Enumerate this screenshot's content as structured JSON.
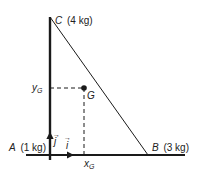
{
  "diagram": {
    "colors": {
      "line": "#1a1a1a",
      "text": "#222222",
      "background": "#ffffff"
    },
    "points": {
      "A": {
        "letter": "A",
        "mass": "(1 kg)"
      },
      "B": {
        "letter": "B",
        "mass": "(3 kg)"
      },
      "C": {
        "letter": "C",
        "mass": "(4 kg)"
      },
      "G": {
        "letter": "G"
      }
    },
    "axes": {
      "x_label": "x",
      "x_sub": "G",
      "y_label": "y",
      "y_sub": "G",
      "unit_i": "i",
      "unit_j": "j",
      "vector_arrow": "→"
    }
  }
}
